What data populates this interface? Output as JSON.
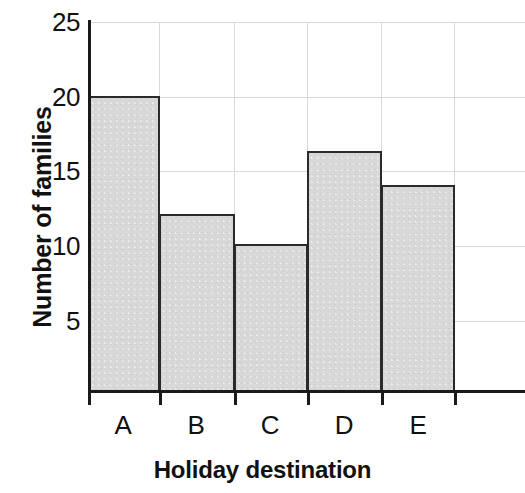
{
  "chart_data": {
    "type": "bar",
    "title": "",
    "subtitle": "",
    "categories": [
      "A",
      "B",
      "C",
      "D",
      "E"
    ],
    "values": [
      20,
      12,
      10,
      16.3,
      14
    ],
    "xlabel": "Holiday destination",
    "ylabel": "Number of families",
    "ylim": [
      0,
      25
    ],
    "xlim": [
      0,
      6
    ],
    "yticks": [
      5,
      10,
      15,
      20,
      25
    ],
    "ytick_labels": [
      "5",
      "10",
      "15",
      "20",
      "25"
    ],
    "grid": true,
    "legend": false,
    "legend_position": "none",
    "bar_gap": 0,
    "colors": {
      "bar_fill": "#d8d8d8",
      "bar_edge": "#2a2a2a",
      "gridline": "#d9d9d9",
      "axis": "#1a1a1a",
      "text": "#111111",
      "background": "#ffffff"
    }
  },
  "axes": {
    "y_title": "Number of families",
    "x_title": "Holiday destination",
    "y_tick_labels": [
      {
        "label": "25",
        "value": 25
      },
      {
        "label": "20",
        "value": 20
      },
      {
        "label": "15",
        "value": 15
      },
      {
        "label": "10",
        "value": 10
      },
      {
        "label": "5",
        "value": 5
      }
    ],
    "x_tick_labels": [
      "A",
      "B",
      "C",
      "D",
      "E"
    ]
  }
}
